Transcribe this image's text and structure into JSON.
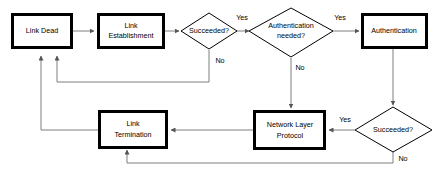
{
  "diagram": {
    "background_color": "#ffffff",
    "line_color": "#7f7f7f",
    "shape_stroke_color": "#000000",
    "shape_fill_color": "#ffffff",
    "nodes": {
      "link_dead": {
        "label_line1": "Link Dead",
        "type": "process"
      },
      "link_establishment": {
        "label_line1": "Link",
        "label_line2": "Establishment",
        "type": "process"
      },
      "succeeded_1": {
        "label_line1": "Succeeded?",
        "type": "decision"
      },
      "authentication_needed": {
        "label_line1": "Authentication",
        "label_line2": "needed?",
        "type": "decision"
      },
      "authentication": {
        "label_line1": "Authentication",
        "type": "process"
      },
      "succeeded_2": {
        "label_line1": "Succeeded?",
        "type": "decision"
      },
      "network_layer_protocol": {
        "label_line1": "Network Layer",
        "label_line2": "Protocol",
        "type": "process"
      },
      "link_termination": {
        "label_line1": "Link",
        "label_line2": "Termination",
        "type": "process"
      }
    },
    "edge_labels": {
      "succeeded1_yes": "Yes",
      "succeeded1_no": "No",
      "auth_needed_yes": "Yes",
      "auth_needed_no": "No",
      "succeeded2_yes": "Yes",
      "succeeded2_no": "No"
    }
  }
}
